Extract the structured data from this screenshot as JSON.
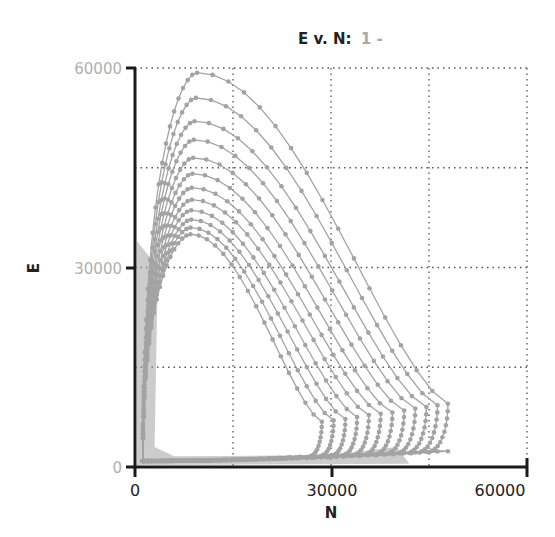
{
  "title": {
    "main": "E v. N:",
    "suffix": "1 -"
  },
  "colors": {
    "series": "#a3a3a3",
    "axis": "#1a1a1a",
    "grid": "#555555",
    "ytick": "#b0b0b0",
    "xtick": "#222222"
  },
  "chart_data": {
    "type": "line",
    "title": "E v. N: 1 -",
    "xlabel": "N",
    "ylabel": "E",
    "xlim": [
      0,
      60000
    ],
    "ylim": [
      0,
      60000
    ],
    "xticks": [
      "0",
      "30000",
      "60000"
    ],
    "yticks": [
      "0",
      "30000",
      "60000"
    ],
    "grid": true,
    "grid_step": 15000,
    "legend": "none",
    "markers": true,
    "series": [
      {
        "name": "loop-1",
        "peak_N": 9500,
        "peak_E": 59300,
        "right_N": 47900,
        "right_E": 9500
      },
      {
        "name": "loop-2",
        "peak_N": 9300,
        "peak_E": 55500,
        "right_N": 46300,
        "right_E": 9300
      },
      {
        "name": "loop-3",
        "peak_N": 9100,
        "peak_E": 52000,
        "right_N": 44600,
        "right_E": 9000
      },
      {
        "name": "loop-4",
        "peak_N": 9000,
        "peak_E": 49200,
        "right_N": 42900,
        "right_E": 8800
      },
      {
        "name": "loop-5",
        "peak_N": 8900,
        "peak_E": 46500,
        "right_N": 41200,
        "right_E": 8500
      },
      {
        "name": "loop-6",
        "peak_N": 8800,
        "peak_E": 44100,
        "right_N": 39400,
        "right_E": 8200
      },
      {
        "name": "loop-7",
        "peak_N": 8700,
        "peak_E": 42000,
        "right_N": 37600,
        "right_E": 8000
      },
      {
        "name": "loop-8",
        "peak_N": 8700,
        "peak_E": 40200,
        "right_N": 35800,
        "right_E": 7800
      },
      {
        "name": "loop-9",
        "peak_N": 8600,
        "peak_E": 38600,
        "right_N": 34000,
        "right_E": 7500
      },
      {
        "name": "loop-10",
        "peak_N": 8600,
        "peak_E": 37200,
        "right_N": 32200,
        "right_E": 7200
      },
      {
        "name": "loop-11",
        "peak_N": 8500,
        "peak_E": 36000,
        "right_N": 30400,
        "right_E": 7000
      },
      {
        "name": "loop-12",
        "peak_N": 8500,
        "peak_E": 35000,
        "right_N": 28600,
        "right_E": 6800
      }
    ]
  }
}
